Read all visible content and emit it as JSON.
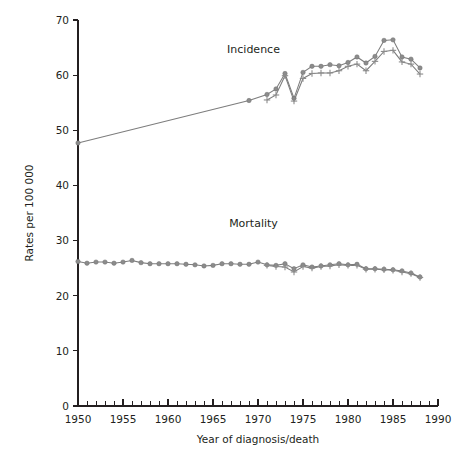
{
  "chart_data": {
    "type": "line",
    "title": "",
    "xlabel": "Year of diagnosis/death",
    "ylabel": "Rates per 100 000",
    "xlim": [
      1950,
      1990
    ],
    "ylim": [
      0,
      70
    ],
    "xticks": [
      1950,
      1955,
      1960,
      1965,
      1970,
      1975,
      1980,
      1985,
      1990
    ],
    "xticklabels": [
      "1950",
      "1955",
      "1960",
      "1965",
      "1970",
      "1975",
      "1980",
      "1985",
      "1990"
    ],
    "yticks": [
      0,
      10,
      20,
      30,
      40,
      50,
      60,
      70
    ],
    "yticklabels": [
      "0",
      "10",
      "20",
      "30",
      "40",
      "50",
      "60",
      "70"
    ],
    "xtick_minor_step": 1,
    "grid": false,
    "legend": "inline-annotations",
    "annotations": [
      {
        "text": "Incidence",
        "x": 1969.5,
        "y": 64.0
      },
      {
        "text": "Mortality",
        "x": 1969.5,
        "y": 32.5
      }
    ],
    "series": [
      {
        "name": "Incidence (circle marker series)",
        "marker": "circle",
        "color": "#8c8c8c",
        "points": [
          {
            "x": 1950,
            "y": 47.7
          },
          {
            "x": 1969,
            "y": 55.4
          },
          {
            "x": 1971,
            "y": 56.5
          },
          {
            "x": 1972,
            "y": 57.5
          },
          {
            "x": 1973,
            "y": 60.3
          },
          {
            "x": 1974,
            "y": 55.8
          },
          {
            "x": 1975,
            "y": 60.5
          },
          {
            "x": 1976,
            "y": 61.6
          },
          {
            "x": 1977,
            "y": 61.6
          },
          {
            "x": 1978,
            "y": 61.9
          },
          {
            "x": 1979,
            "y": 61.7
          },
          {
            "x": 1980,
            "y": 62.3
          },
          {
            "x": 1981,
            "y": 63.3
          },
          {
            "x": 1982,
            "y": 62.2
          },
          {
            "x": 1983,
            "y": 63.4
          },
          {
            "x": 1984,
            "y": 66.3
          },
          {
            "x": 1985,
            "y": 66.4
          },
          {
            "x": 1986,
            "y": 63.3
          },
          {
            "x": 1987,
            "y": 62.9
          },
          {
            "x": 1988,
            "y": 61.3
          }
        ]
      },
      {
        "name": "Incidence (plus marker series)",
        "marker": "plus",
        "color": "#8c8c8c",
        "points": [
          {
            "x": 1971,
            "y": 55.5
          },
          {
            "x": 1972,
            "y": 56.4
          },
          {
            "x": 1973,
            "y": 59.9
          },
          {
            "x": 1974,
            "y": 55.3
          },
          {
            "x": 1975,
            "y": 59.4
          },
          {
            "x": 1976,
            "y": 60.3
          },
          {
            "x": 1977,
            "y": 60.4
          },
          {
            "x": 1978,
            "y": 60.4
          },
          {
            "x": 1979,
            "y": 60.8
          },
          {
            "x": 1980,
            "y": 61.6
          },
          {
            "x": 1981,
            "y": 62.0
          },
          {
            "x": 1982,
            "y": 60.8
          },
          {
            "x": 1983,
            "y": 62.5
          },
          {
            "x": 1984,
            "y": 64.3
          },
          {
            "x": 1985,
            "y": 64.5
          },
          {
            "x": 1986,
            "y": 62.4
          },
          {
            "x": 1987,
            "y": 62.0
          },
          {
            "x": 1988,
            "y": 60.2
          }
        ]
      },
      {
        "name": "Mortality (circle marker series)",
        "marker": "circle",
        "color": "#8c8c8c",
        "points": [
          {
            "x": 1950,
            "y": 26.2
          },
          {
            "x": 1951,
            "y": 25.9
          },
          {
            "x": 1952,
            "y": 26.1
          },
          {
            "x": 1953,
            "y": 26.1
          },
          {
            "x": 1954,
            "y": 25.9
          },
          {
            "x": 1955,
            "y": 26.1
          },
          {
            "x": 1956,
            "y": 26.4
          },
          {
            "x": 1957,
            "y": 26.0
          },
          {
            "x": 1958,
            "y": 25.8
          },
          {
            "x": 1959,
            "y": 25.8
          },
          {
            "x": 1960,
            "y": 25.8
          },
          {
            "x": 1961,
            "y": 25.8
          },
          {
            "x": 1962,
            "y": 25.7
          },
          {
            "x": 1963,
            "y": 25.6
          },
          {
            "x": 1964,
            "y": 25.4
          },
          {
            "x": 1965,
            "y": 25.5
          },
          {
            "x": 1966,
            "y": 25.8
          },
          {
            "x": 1967,
            "y": 25.8
          },
          {
            "x": 1968,
            "y": 25.7
          },
          {
            "x": 1969,
            "y": 25.7
          },
          {
            "x": 1970,
            "y": 26.1
          },
          {
            "x": 1971,
            "y": 25.6
          },
          {
            "x": 1972,
            "y": 25.5
          },
          {
            "x": 1973,
            "y": 25.8
          },
          {
            "x": 1974,
            "y": 24.9
          },
          {
            "x": 1975,
            "y": 25.6
          },
          {
            "x": 1976,
            "y": 25.2
          },
          {
            "x": 1977,
            "y": 25.4
          },
          {
            "x": 1978,
            "y": 25.6
          },
          {
            "x": 1979,
            "y": 25.8
          },
          {
            "x": 1980,
            "y": 25.6
          },
          {
            "x": 1981,
            "y": 25.7
          },
          {
            "x": 1982,
            "y": 24.9
          },
          {
            "x": 1983,
            "y": 24.9
          },
          {
            "x": 1984,
            "y": 24.8
          },
          {
            "x": 1985,
            "y": 24.7
          },
          {
            "x": 1986,
            "y": 24.5
          },
          {
            "x": 1987,
            "y": 24.1
          },
          {
            "x": 1988,
            "y": 23.4
          }
        ]
      },
      {
        "name": "Mortality (plus marker series)",
        "marker": "plus",
        "color": "#8c8c8c",
        "points": [
          {
            "x": 1971,
            "y": 25.5
          },
          {
            "x": 1972,
            "y": 25.3
          },
          {
            "x": 1973,
            "y": 25.2
          },
          {
            "x": 1974,
            "y": 24.3
          },
          {
            "x": 1975,
            "y": 25.3
          },
          {
            "x": 1976,
            "y": 25.0
          },
          {
            "x": 1977,
            "y": 25.3
          },
          {
            "x": 1978,
            "y": 25.4
          },
          {
            "x": 1979,
            "y": 25.6
          },
          {
            "x": 1980,
            "y": 25.5
          },
          {
            "x": 1981,
            "y": 25.5
          },
          {
            "x": 1982,
            "y": 24.8
          },
          {
            "x": 1983,
            "y": 24.8
          },
          {
            "x": 1984,
            "y": 24.7
          },
          {
            "x": 1985,
            "y": 24.6
          },
          {
            "x": 1986,
            "y": 24.3
          },
          {
            "x": 1987,
            "y": 24.0
          },
          {
            "x": 1988,
            "y": 23.3
          }
        ]
      }
    ]
  }
}
